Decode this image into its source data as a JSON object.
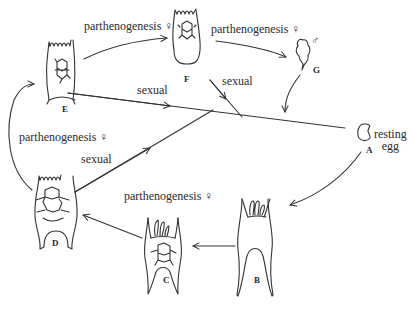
{
  "diagram": {
    "type": "life-cycle",
    "colors": {
      "ink": "#333333",
      "background": "#ffffff"
    },
    "nodes": [
      {
        "id": "A",
        "label": "A",
        "caption": [
          "resting",
          "egg"
        ]
      },
      {
        "id": "B",
        "label": "B"
      },
      {
        "id": "C",
        "label": "C"
      },
      {
        "id": "D",
        "label": "D"
      },
      {
        "id": "E",
        "label": "E"
      },
      {
        "id": "F",
        "label": "F"
      },
      {
        "id": "G",
        "label": "G",
        "sex_symbol": "♂"
      }
    ],
    "edges": [
      {
        "from": "A",
        "to": "B",
        "label": ""
      },
      {
        "from": "B",
        "to": "C",
        "label": ""
      },
      {
        "from": "C",
        "to": "D",
        "label": "parthenogenesis ♀"
      },
      {
        "from": "D",
        "to": "E",
        "label": "parthenogenesis ♀"
      },
      {
        "from": "E",
        "to": "F",
        "label": "parthenogenesis ♀"
      },
      {
        "from": "F",
        "to": "G",
        "label": "parthenogenesis ♀"
      },
      {
        "from": "E",
        "to": "A",
        "label": "sexual"
      },
      {
        "from": "F",
        "to": "A",
        "label": "sexual"
      },
      {
        "from": "D",
        "to": "A",
        "label": "sexual"
      },
      {
        "from": "G",
        "to": "A",
        "label": ""
      }
    ],
    "labels": {
      "e_to_f": "parthenogenesis ♀",
      "f_to_g": "parthenogenesis ♀",
      "d_to_e": "parthenogenesis ♀",
      "c_to_d": "parthenogenesis ♀",
      "e_sexual": "sexual",
      "f_sexual": "sexual",
      "d_sexual": "sexual",
      "node_a": "A",
      "node_b": "B",
      "node_c": "C",
      "node_d": "D",
      "node_e": "E",
      "node_f": "F",
      "node_g": "G",
      "male_symbol": "♂",
      "egg_line1": "resting",
      "egg_line2": "egg"
    }
  }
}
